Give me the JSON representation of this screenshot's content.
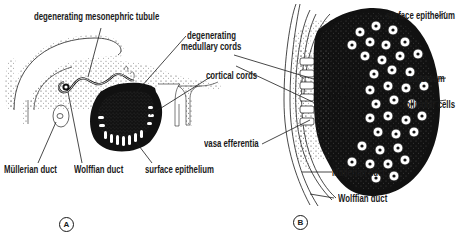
{
  "figure": {
    "panels": [
      {
        "id": "A",
        "badge": "A",
        "labels": {
          "mesonephric_tubule": "degenerating mesonephric tubule",
          "medullary_cords": "degenerating\nmedullary cords",
          "medullary_cords_line1": "degenerating",
          "medullary_cords_line2": "medullary cords",
          "cortical_cords": "cortical cords",
          "mullerian_duct": "Müllerian duct",
          "wolffian_duct": "Wolffian duct",
          "surface_epithelium": "surface epithelium"
        }
      },
      {
        "id": "B",
        "badge": "B",
        "labels": {
          "surface_epithelium": "surface epithelium",
          "oogonium": "oogonium",
          "follicular_cells": "follicular cells",
          "vasa_efferentia": "vasa efferentia",
          "mullerian_duct": "Müllerian duct",
          "wolffian_duct": "Wolffian duct"
        }
      }
    ],
    "colors": {
      "ink": "#1a1a1a",
      "stipple": "#555555",
      "background": "#ffffff"
    }
  }
}
